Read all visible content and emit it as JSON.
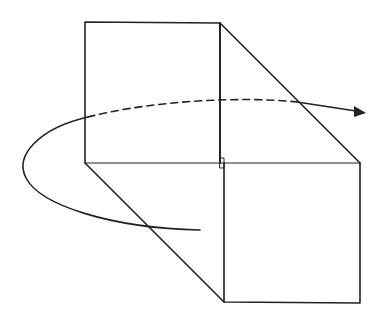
{
  "diagram": {
    "stroke_color": "#222222",
    "background": "#ffffff",
    "shapes": {
      "upper_rect": {
        "x1": 85,
        "y1": 22,
        "x2": 220,
        "y2": 163
      },
      "lower_rect": {
        "x1": 224,
        "y1": 163,
        "x2": 360,
        "y2": 302
      },
      "axis_line": {
        "x1": 85,
        "y1": 163,
        "x2": 360,
        "y2": 163
      },
      "diag_top": {
        "x1": 220,
        "y1": 23,
        "x2": 360,
        "y2": 163
      },
      "diag_bottom": {
        "x1": 85,
        "y1": 163,
        "x2": 224,
        "y2": 302
      },
      "right_angle_mark": {
        "x": 220,
        "y": 158,
        "w": 4,
        "h": 10
      }
    }
  }
}
